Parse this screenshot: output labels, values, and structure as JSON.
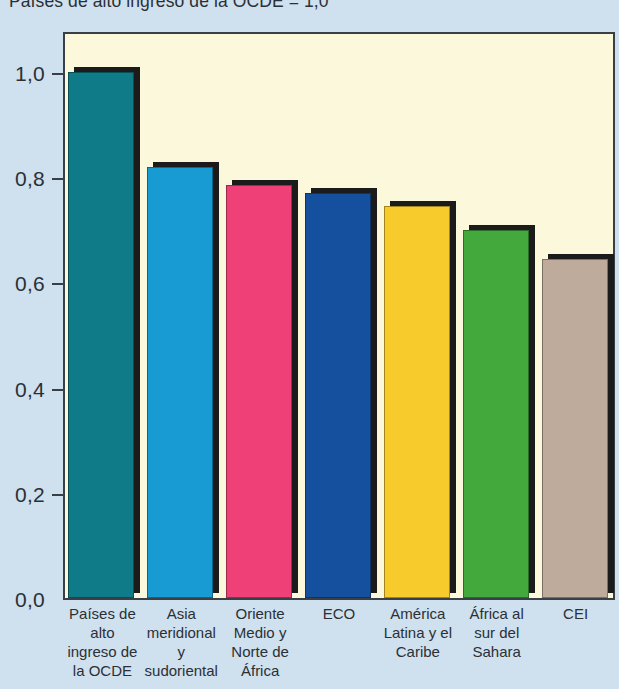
{
  "chart_data": {
    "type": "bar",
    "title": "Países de alto ingreso de la OCDE = 1,0",
    "xlabel": "",
    "ylabel": "",
    "ylim": [
      0.0,
      1.08
    ],
    "grid": false,
    "legend": "none",
    "ytick_labels": [
      "1,0",
      "0,8",
      "0,6",
      "0,4",
      "0,2",
      "0,0"
    ],
    "ytick_values": [
      1.0,
      0.8,
      0.6,
      0.4,
      0.2,
      0.0
    ],
    "categories": [
      "Países de alto ingreso de la OCDE",
      "Asia meridional y sudoriental",
      "Oriente Medio y Norte de África",
      "ECO",
      "América Latina y el Caribe",
      "África al sur del Sahara",
      "CEI"
    ],
    "values": [
      1.0,
      0.82,
      0.785,
      0.77,
      0.745,
      0.7,
      0.645
    ],
    "bar_colors": [
      "#0f7a88",
      "#189ad3",
      "#ef4077",
      "#14509e",
      "#f7cb2c",
      "#43a93c",
      "#bfab9b"
    ],
    "shadow_color": "#1b1b1b"
  },
  "figure": {
    "background_color": "#cfe0ee",
    "plot_background_color": "#fbf8dc",
    "axis_color": "#3a3f45",
    "text_color": "#2b3036"
  }
}
